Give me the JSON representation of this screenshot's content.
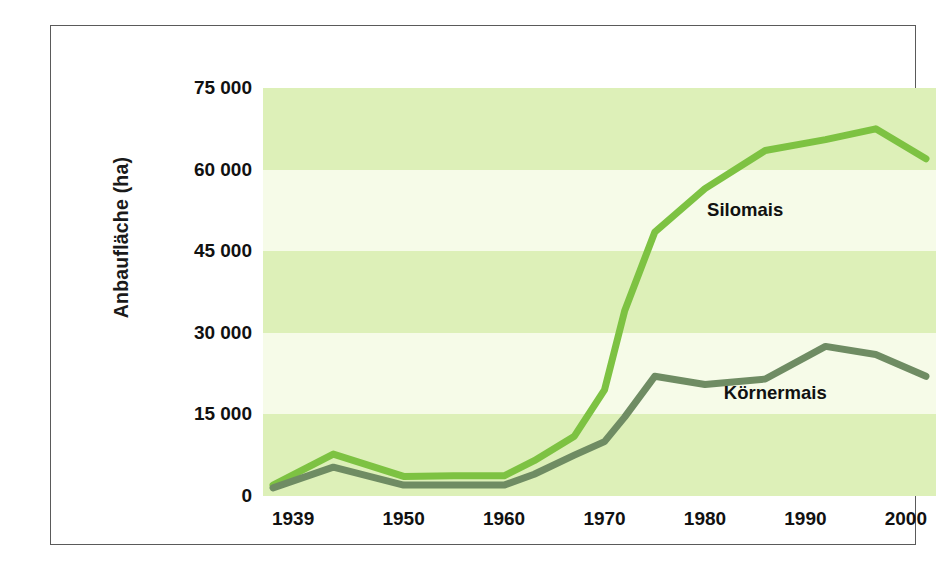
{
  "figure": {
    "background_color": "#ffffff",
    "frame_color": "#5a5a5a"
  },
  "axes": {
    "y_title": "Anbaufläche (ha)",
    "y_ticks": [
      "0",
      "15 000",
      "30 000",
      "45 000",
      "60 000",
      "75 000"
    ],
    "x_ticks": [
      "1939",
      "1950",
      "1960",
      "1970",
      "1980",
      "1990",
      "2000"
    ]
  },
  "colors": {
    "silomais_line": "#7dc242",
    "koernermais_line": "#6f8c63",
    "band_green": "#ddf0b8",
    "band_pale": "#f6fbe8",
    "text": "#111111"
  },
  "chart_data": {
    "type": "line",
    "title": "",
    "xlabel": "",
    "ylabel": "Anbaufläche (ha)",
    "xlim": [
      1936,
      2003
    ],
    "ylim": [
      0,
      75000
    ],
    "ytick_values": [
      0,
      15000,
      30000,
      45000,
      60000,
      75000
    ],
    "xtick_values": [
      1939,
      1950,
      1960,
      1970,
      1980,
      1990,
      2000
    ],
    "grid": false,
    "banded_background": true,
    "band_boundaries": [
      0,
      15000,
      30000,
      45000,
      60000,
      75000
    ],
    "legend": "inline-labels",
    "series": [
      {
        "name": "Silomais",
        "color": "#7dc242",
        "label_x": 1984,
        "label_y": 52500,
        "x": [
          1937,
          1943,
          1950,
          1955,
          1960,
          1963,
          1967,
          1970,
          1972,
          1975,
          1980,
          1986,
          1992,
          1997,
          2002
        ],
        "values": [
          2000,
          7700,
          3600,
          3700,
          3700,
          6500,
          11000,
          19500,
          34000,
          48500,
          56500,
          63500,
          65500,
          67500,
          62000
        ]
      },
      {
        "name": "Körnermais",
        "color": "#6f8c63",
        "label_x": 1987,
        "label_y": 19000,
        "x": [
          1937,
          1943,
          1950,
          1955,
          1960,
          1963,
          1967,
          1970,
          1972,
          1975,
          1980,
          1986,
          1992,
          1997,
          2002
        ],
        "values": [
          1500,
          5300,
          2000,
          2000,
          2000,
          4000,
          7500,
          10000,
          14500,
          22000,
          20500,
          21500,
          27500,
          26000,
          22000
        ]
      }
    ]
  },
  "annotations": [
    {
      "name": "silomais-label",
      "text": "Silomais"
    },
    {
      "name": "koernermais-label",
      "text": "Körnermais"
    }
  ]
}
